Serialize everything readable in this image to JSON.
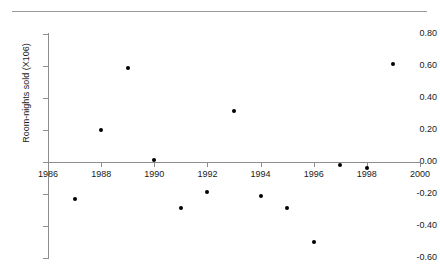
{
  "figure": {
    "top_rule_ghost_text": ""
  },
  "chart_data": {
    "type": "scatter",
    "title": "",
    "xlabel": "",
    "ylabel": "Room-nights sold (X106)",
    "xlim": [
      1986,
      2000
    ],
    "ylim": [
      -0.6,
      0.8
    ],
    "grid": false,
    "legend": null,
    "x_ticks": [
      1986,
      1988,
      1990,
      1992,
      1994,
      1996,
      1998,
      2000
    ],
    "x_tick_labels": [
      "1986",
      "1988",
      "1990",
      "1992",
      "1994",
      "1996",
      "1998",
      "2000"
    ],
    "y_ticks": [
      0.8,
      0.6,
      0.4,
      0.2,
      0.0,
      -0.2,
      -0.4,
      -0.6
    ],
    "y_tick_labels": [
      "0.80",
      "0.60",
      "0.40",
      "0.20",
      "0.00",
      "-0.20",
      "-0.40",
      "-0.60"
    ],
    "marker": "filled-circle",
    "marker_color": "#000000",
    "x": [
      1987,
      1988,
      1989,
      1990,
      1991,
      1992,
      1993,
      1994,
      1995,
      1996,
      1997,
      1998,
      1999
    ],
    "values": [
      -0.23,
      0.2,
      0.59,
      0.01,
      -0.29,
      -0.19,
      0.32,
      -0.21,
      -0.29,
      -0.5,
      -0.02,
      -0.04,
      0.61
    ],
    "points": [
      {
        "x": 1987,
        "y": -0.23
      },
      {
        "x": 1988,
        "y": 0.2
      },
      {
        "x": 1989,
        "y": 0.59
      },
      {
        "x": 1990,
        "y": 0.01
      },
      {
        "x": 1991,
        "y": -0.29
      },
      {
        "x": 1992,
        "y": -0.19
      },
      {
        "x": 1993,
        "y": 0.32
      },
      {
        "x": 1994,
        "y": -0.21
      },
      {
        "x": 1995,
        "y": -0.29
      },
      {
        "x": 1996,
        "y": -0.5
      },
      {
        "x": 1997,
        "y": -0.02
      },
      {
        "x": 1998,
        "y": -0.04
      },
      {
        "x": 1999,
        "y": 0.61
      }
    ]
  }
}
